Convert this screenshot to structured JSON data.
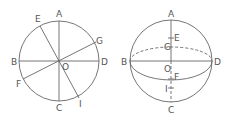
{
  "figure": {
    "left": {
      "name": "circle-with-diameters",
      "labels": {
        "A": "A",
        "B": "B",
        "C": "C",
        "D": "D",
        "E": "E",
        "F": "F",
        "G": "G",
        "I": "I",
        "O": "O"
      }
    },
    "right": {
      "name": "sphere-with-equator",
      "labels": {
        "A": "A",
        "B": "B",
        "C": "C",
        "D": "D",
        "E": "E",
        "F": "F",
        "G": "G",
        "I": "I",
        "O": "O"
      }
    }
  },
  "colors": {
    "line": "#666666",
    "text": "#555555",
    "background": "#ffffff"
  }
}
